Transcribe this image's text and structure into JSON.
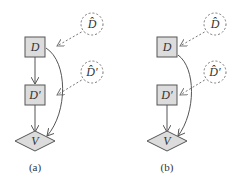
{
  "diagrams": [
    {
      "caption": "(a)",
      "nodes": {
        "D": {
          "label": "D",
          "shape": "box"
        },
        "Dhat": {
          "label": "D̂",
          "shape": "dashed-circle"
        },
        "Dprime": {
          "label": "D′",
          "shape": "box"
        },
        "Dprimehat": {
          "label": "D̂′",
          "shape": "dashed-circle"
        },
        "V": {
          "label": "V",
          "shape": "diamond"
        }
      },
      "edges": [
        {
          "from": "Dhat",
          "to": "D",
          "style": "dashed"
        },
        {
          "from": "Dprimehat",
          "to": "Dprime",
          "style": "dashed"
        },
        {
          "from": "D",
          "to": "Dprime",
          "style": "solid"
        },
        {
          "from": "Dprime",
          "to": "V",
          "style": "solid"
        },
        {
          "from": "D",
          "to": "V",
          "style": "solid-curved"
        }
      ]
    },
    {
      "caption": "(b)",
      "nodes": {
        "D": {
          "label": "D",
          "shape": "box"
        },
        "Dhat": {
          "label": "D̂",
          "shape": "dashed-circle"
        },
        "Dprime": {
          "label": "D′",
          "shape": "box"
        },
        "Dprimehat": {
          "label": "D̂′",
          "shape": "dashed-circle"
        },
        "V": {
          "label": "V",
          "shape": "diamond"
        }
      },
      "edges": [
        {
          "from": "Dhat",
          "to": "D",
          "style": "dashed"
        },
        {
          "from": "Dprimehat",
          "to": "Dprime",
          "style": "dashed"
        },
        {
          "from": "Dprime",
          "to": "V",
          "style": "solid"
        },
        {
          "from": "D",
          "to": "V",
          "style": "solid-curved"
        }
      ]
    }
  ]
}
